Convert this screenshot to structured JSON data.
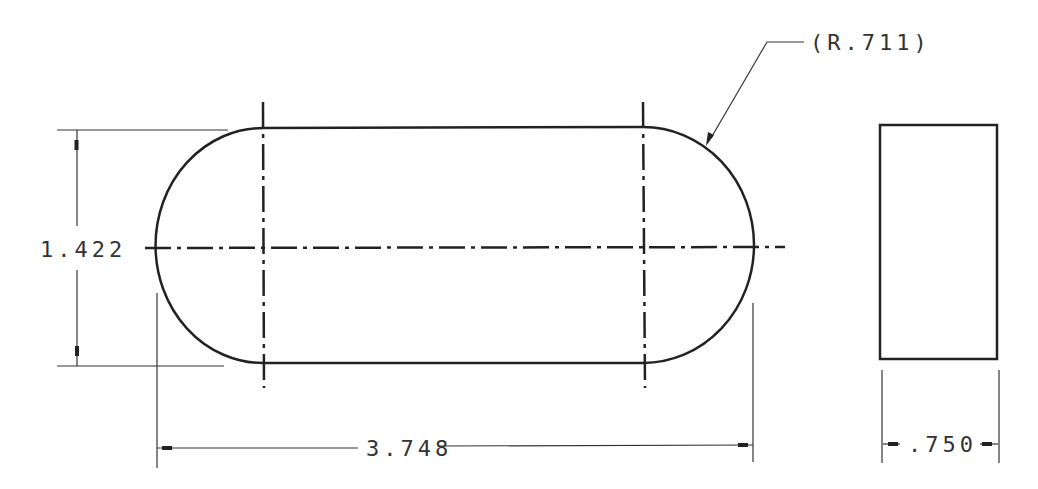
{
  "drawing": {
    "type": "engineering drawing",
    "views": [
      "front-view-slot",
      "side-view-rectangle"
    ],
    "stroke_color": "#222222",
    "background": "#ffffff"
  },
  "dimensions": {
    "radius_note": "(R.711)",
    "height": "1.422",
    "length": "3.748",
    "thickness": ".750"
  }
}
